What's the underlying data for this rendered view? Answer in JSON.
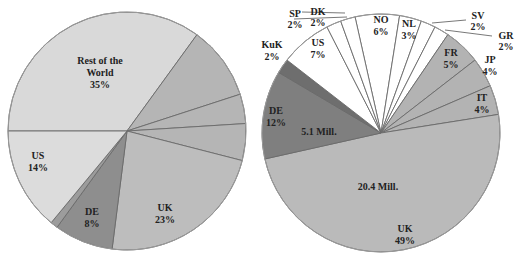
{
  "chart_data": [
    {
      "type": "pie",
      "title": "",
      "center": [
        127,
        131
      ],
      "radius": 119,
      "start_angle_deg": -90,
      "slices": [
        {
          "label": "Rest of the World",
          "value": 35,
          "text": "35%",
          "color": "#d9d9d9"
        },
        {
          "label": "",
          "value": 10,
          "text": "",
          "color": "#b5b5b5"
        },
        {
          "label": "",
          "value": 4,
          "text": "",
          "color": "#b5b5b5"
        },
        {
          "label": "",
          "value": 5,
          "text": "",
          "color": "#b5b5b5"
        },
        {
          "label": "UK",
          "value": 23,
          "text": "23%",
          "color": "#bdbdbd"
        },
        {
          "label": "DE",
          "value": 8,
          "text": "8%",
          "color": "#8e8e8e"
        },
        {
          "label": "",
          "value": 1,
          "text": "",
          "color": "#9c9c9c"
        },
        {
          "label": "US",
          "value": 14,
          "text": "14%",
          "color": "#dcdcdc"
        }
      ]
    },
    {
      "type": "pie",
      "title": "",
      "center": [
        381,
        133
      ],
      "radius": 119,
      "start_angle_deg": -12.6,
      "slices": [
        {
          "label": "NO",
          "value": 6,
          "text": "6%",
          "color": "#ffffff"
        },
        {
          "label": "NL",
          "value": 3,
          "text": "3%",
          "color": "#ffffff"
        },
        {
          "label": "SV",
          "value": 2,
          "text": "2%",
          "color": "#ffffff"
        },
        {
          "label": "GR",
          "value": 2,
          "text": "2%",
          "color": "#ffffff"
        },
        {
          "label": "FR",
          "value": 5,
          "text": "5%",
          "color": "#b3b3b3"
        },
        {
          "label": "JP",
          "value": 4,
          "text": "4%",
          "color": "#b3b3b3"
        },
        {
          "label": "IT",
          "value": 4,
          "text": "4%",
          "color": "#b3b3b3"
        },
        {
          "label": "UK",
          "value": 49,
          "text": "49%",
          "color": "#bababa",
          "annotation": "20.4 Mill."
        },
        {
          "label": "DE",
          "value": 12,
          "text": "12%",
          "color": "#7f7f7f",
          "annotation": "5.1 Mill."
        },
        {
          "label": "KuK",
          "value": 2,
          "text": "2%",
          "color": "#6e6e6e"
        },
        {
          "label": "US",
          "value": 7,
          "text": "7%",
          "color": "#ffffff"
        },
        {
          "label": "SP",
          "value": 2,
          "text": "2%",
          "color": "#ffffff"
        },
        {
          "label": "DK",
          "value": 2,
          "text": "2%",
          "color": "#ffffff"
        }
      ]
    }
  ],
  "labels": {
    "left": {
      "row_1": "Rest of the",
      "row_2": "World",
      "row_pct": "35%",
      "us": "US",
      "us_pct": "14%",
      "de": "DE",
      "de_pct": "8%",
      "uk": "UK",
      "uk_pct": "23%"
    },
    "right": {
      "sp": "SP",
      "sp_pct": "2%",
      "dk": "DK",
      "dk_pct": "2%",
      "no": "NO",
      "no_pct": "6%",
      "nl": "NL",
      "nl_pct": "3%",
      "sv": "SV",
      "sv_pct": "2%",
      "gr": "GR",
      "gr_pct": "2%",
      "kuk": "KuK",
      "kuk_pct": "2%",
      "us": "US",
      "us_pct": "7%",
      "fr": "FR",
      "fr_pct": "5%",
      "jp": "JP",
      "jp_pct": "4%",
      "it": "IT",
      "it_pct": "4%",
      "de": "DE",
      "de_pct": "12%",
      "de_mill": "5.1 Mill.",
      "uk_mill": "20.4 Mill.",
      "uk": "UK",
      "uk_pct": "49%"
    }
  }
}
